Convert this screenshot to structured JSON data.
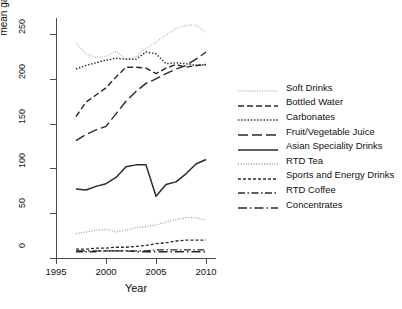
{
  "chart_data": {
    "type": "line",
    "title": "",
    "xlabel": "Year",
    "ylabel": "mean gallons/capita/year",
    "xlim": [
      1995,
      2011
    ],
    "ylim": [
      0,
      268
    ],
    "xticks": [
      1995,
      2000,
      2005,
      2010
    ],
    "yticks": [
      0,
      50,
      100,
      150,
      200,
      250
    ],
    "grid": false,
    "legend_position": "right",
    "x": [
      1997,
      1998,
      1999,
      2000,
      2001,
      2002,
      2003,
      2004,
      2005,
      2006,
      2007,
      2008,
      2009,
      2010
    ],
    "series": [
      {
        "name": "Soft Drinks",
        "style": "fine-dotted-light",
        "color": "#b9b9b9",
        "values": [
          240,
          228,
          224,
          225,
          231,
          222,
          225,
          234,
          241,
          249,
          256,
          260,
          260,
          252
        ]
      },
      {
        "name": "Bottled Water",
        "style": "dashed",
        "color": "#2a2a2a",
        "values": [
          158,
          174,
          182,
          190,
          202,
          213,
          213,
          212,
          206,
          212,
          216,
          213,
          215,
          216
        ]
      },
      {
        "name": "Carbonates",
        "style": "dotted",
        "color": "#2a2a2a",
        "values": [
          211,
          215,
          218,
          221,
          223,
          222,
          222,
          230,
          228,
          217,
          218,
          217,
          215,
          216
        ]
      },
      {
        "name": "Fruit/Vegetable Juice",
        "style": "long-dashed",
        "color": "#2a2a2a",
        "values": [
          131,
          138,
          143,
          147,
          161,
          175,
          186,
          195,
          200,
          206,
          211,
          215,
          222,
          230
        ]
      },
      {
        "name": "Asian Speciality Drinks",
        "style": "solid",
        "color": "#2a2a2a",
        "values": [
          77,
          76,
          80,
          83,
          90,
          102,
          104,
          104,
          69,
          82,
          85,
          94,
          105,
          110
        ]
      },
      {
        "name": "RTD Tea",
        "style": "fine-dotted",
        "color": "#9d9d9d",
        "values": [
          27,
          29,
          31,
          32,
          29,
          31,
          34,
          35,
          37,
          40,
          43,
          45,
          45,
          42
        ]
      },
      {
        "name": "Sports and Energy Drinks",
        "style": "dot-dash-fine",
        "color": "#2a2a2a",
        "values": [
          10,
          10,
          11,
          11,
          12,
          12,
          13,
          14,
          16,
          17,
          19,
          20,
          20,
          20
        ]
      },
      {
        "name": "RTD Coffee",
        "style": "dash-dot",
        "color": "#2a2a2a",
        "values": [
          7,
          7,
          7,
          8,
          8,
          8,
          8,
          8,
          9,
          9,
          9,
          9,
          9,
          9
        ]
      },
      {
        "name": "Concentrates",
        "style": "long-dash-dot",
        "color": "#2a2a2a",
        "values": [
          8,
          8,
          8,
          8,
          8,
          8,
          7,
          7,
          7,
          7,
          7,
          7,
          7,
          7
        ]
      }
    ]
  },
  "axes": {
    "ylabel": "mean gallons/capita/year",
    "xlabel": "Year",
    "yticks": [
      "0",
      "50",
      "100",
      "150",
      "200",
      "250"
    ],
    "xticks": [
      "1995",
      "2000",
      "2005",
      "2010"
    ]
  },
  "legend": {
    "items": [
      {
        "label": "Soft Drinks"
      },
      {
        "label": "Bottled Water"
      },
      {
        "label": "Carbonates"
      },
      {
        "label": "Fruit/Vegetable Juice"
      },
      {
        "label": "Asian Speciality Drinks"
      },
      {
        "label": "RTD Tea"
      },
      {
        "label": "Sports and Energy Drinks"
      },
      {
        "label": "RTD Coffee"
      },
      {
        "label": "Concentrates"
      }
    ]
  }
}
